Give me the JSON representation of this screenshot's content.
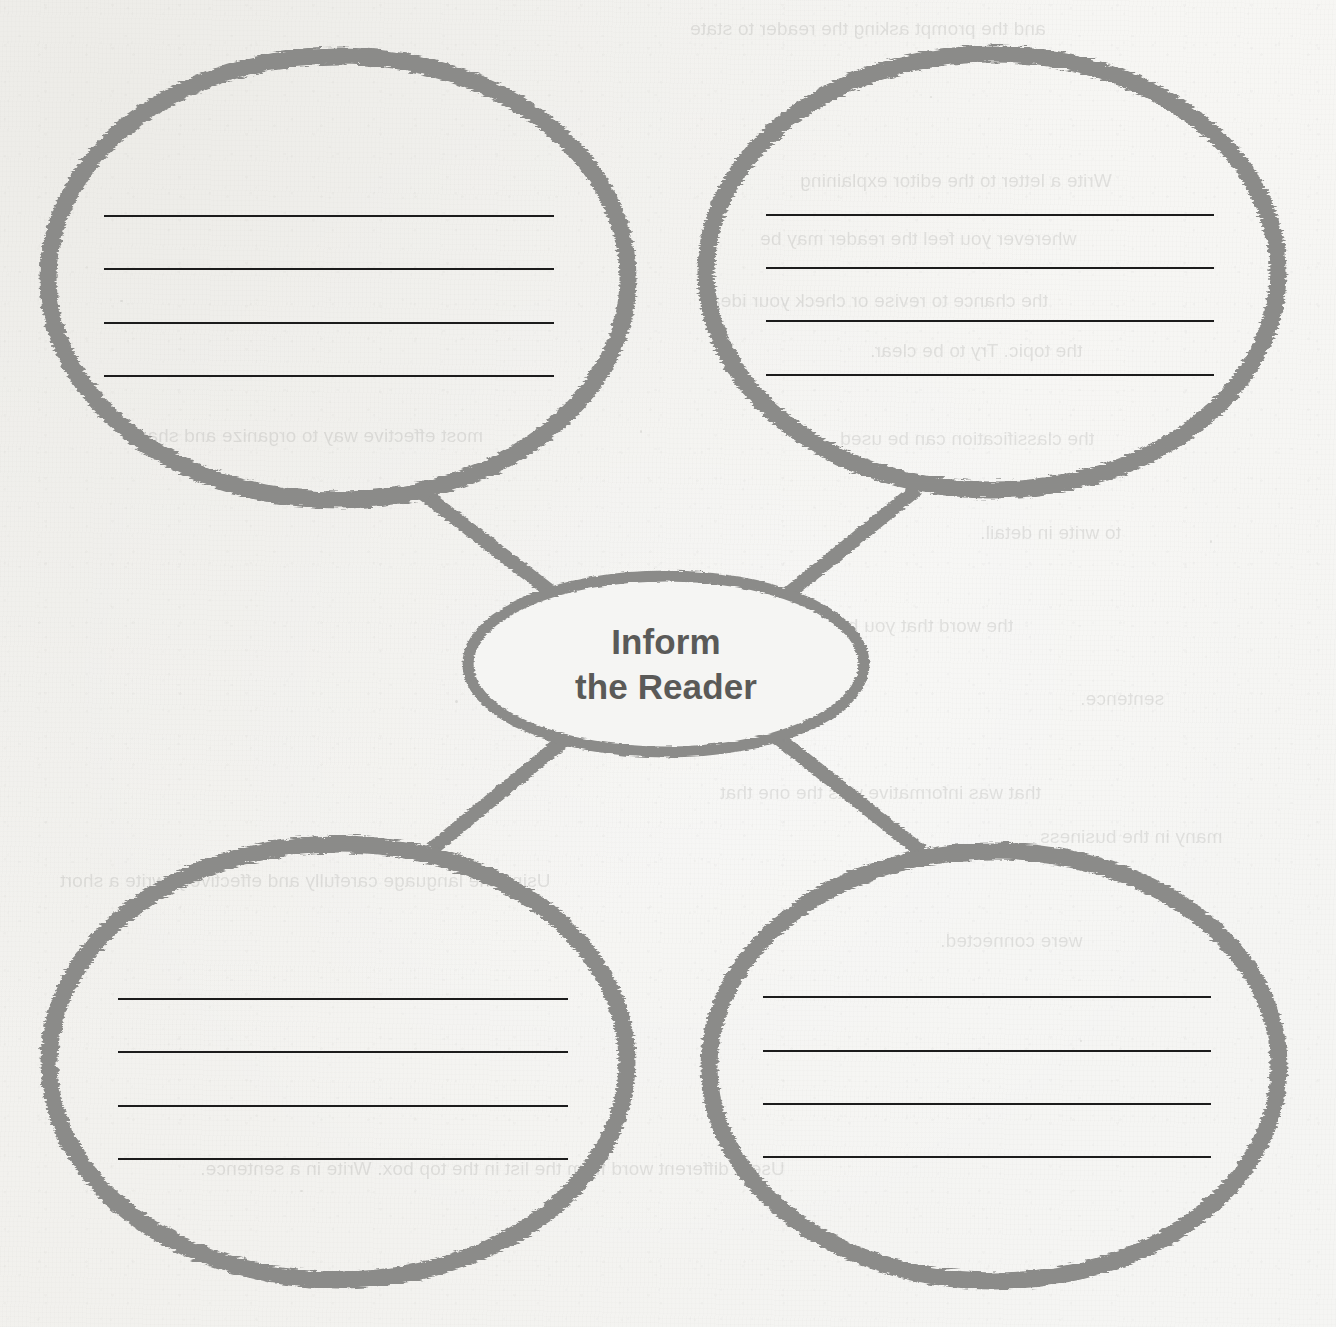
{
  "document": {
    "type": "graphic-organizer-worksheet",
    "organizer_style": "concept-web",
    "paper_color": "#f5f5f3",
    "ink_color": "#8b8b89",
    "rule_color": "#1c1c1c",
    "label_color": "#5a5a58"
  },
  "center_node": {
    "name": "center-oval",
    "line1": "Inform",
    "line2": "the Reader",
    "full_text": "Inform the Reader"
  },
  "branches": [
    {
      "id": "top-left",
      "position": "top-left",
      "text": "",
      "rule_count": 4
    },
    {
      "id": "top-right",
      "position": "top-right",
      "text": "",
      "rule_count": 4
    },
    {
      "id": "bottom-left",
      "position": "bottom-left",
      "text": "",
      "rule_count": 4
    },
    {
      "id": "bottom-right",
      "position": "bottom-right",
      "text": "",
      "rule_count": 4
    }
  ],
  "connectors": [
    {
      "from": "center-oval",
      "to": "top-left"
    },
    {
      "from": "center-oval",
      "to": "top-right"
    },
    {
      "from": "center-oval",
      "to": "bottom-left"
    },
    {
      "from": "center-oval",
      "to": "bottom-right"
    }
  ],
  "bleed_through_text": [
    "and the prompt asking the reader to state",
    "Write a letter to the editor explaining",
    "wherever you feel the reader may be",
    "the chance to revise or check your ideas",
    "the topic. Try to be clear.",
    "most effective way to organize and share",
    "the classification can be used",
    "to write in detail.",
    "the word that you have in mind to use",
    "sentence.",
    "that was informative was the one that",
    "many in the business",
    "Using the language carefully and effectively, write a short",
    "were connected.",
    "Use a different word from the list in the top box. Write in a sentence."
  ]
}
